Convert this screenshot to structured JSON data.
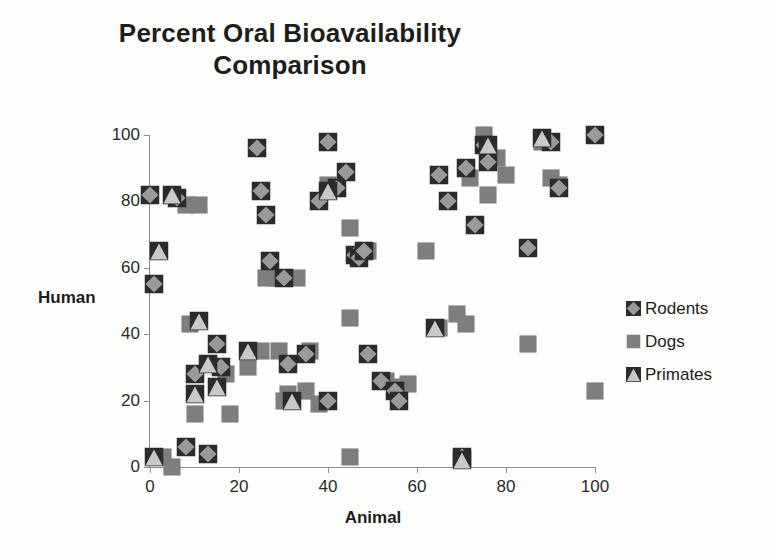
{
  "chart_data": {
    "type": "scatter",
    "title": "Percent Oral Bioavailability Comparison",
    "title_lines": [
      "Percent Oral Bioavailability",
      "Comparison"
    ],
    "xlabel": "Animal",
    "ylabel": "Human",
    "xlim": [
      0,
      100
    ],
    "ylim": [
      0,
      100
    ],
    "xticks": [
      0,
      20,
      40,
      60,
      80,
      100
    ],
    "yticks": [
      0,
      20,
      40,
      60,
      80,
      100
    ],
    "grid": false,
    "legend_position": "right",
    "colors": {
      "rodents": "#9a9a9a",
      "dogs": "#7e7e7e",
      "primates": "#c9c9c9",
      "marker_outline": "#2b2b2b",
      "axis": "#8c8c8c",
      "text": "#1d1d1d",
      "background": "#fdfdfc"
    },
    "series": [
      {
        "name": "Rodents",
        "marker": "diamond",
        "color": "#9a9a9a",
        "points": [
          [
            0,
            82
          ],
          [
            1,
            55
          ],
          [
            6,
            81
          ],
          [
            8,
            6
          ],
          [
            10,
            28
          ],
          [
            13,
            4
          ],
          [
            15,
            37
          ],
          [
            16,
            30
          ],
          [
            24,
            96
          ],
          [
            25,
            83
          ],
          [
            26,
            76
          ],
          [
            27,
            62
          ],
          [
            30,
            57
          ],
          [
            31,
            31
          ],
          [
            35,
            34
          ],
          [
            38,
            80
          ],
          [
            40,
            98
          ],
          [
            40,
            20
          ],
          [
            42,
            84
          ],
          [
            44,
            89
          ],
          [
            46,
            64
          ],
          [
            47,
            63
          ],
          [
            48,
            65
          ],
          [
            49,
            34
          ],
          [
            52,
            26
          ],
          [
            55,
            23
          ],
          [
            56,
            20
          ],
          [
            65,
            88
          ],
          [
            67,
            80
          ],
          [
            70,
            3
          ],
          [
            71,
            90
          ],
          [
            73,
            73
          ],
          [
            75,
            97
          ],
          [
            76,
            92
          ],
          [
            85,
            66
          ],
          [
            90,
            98
          ],
          [
            92,
            84
          ],
          [
            100,
            100
          ]
        ]
      },
      {
        "name": "Dogs",
        "marker": "square",
        "color": "#7e7e7e",
        "points": [
          [
            3,
            3
          ],
          [
            5,
            0
          ],
          [
            8,
            79
          ],
          [
            9,
            43
          ],
          [
            10,
            16
          ],
          [
            11,
            79
          ],
          [
            17,
            28
          ],
          [
            18,
            16
          ],
          [
            22,
            30
          ],
          [
            25,
            35
          ],
          [
            26,
            57
          ],
          [
            28,
            57
          ],
          [
            29,
            35
          ],
          [
            30,
            20
          ],
          [
            31,
            22
          ],
          [
            33,
            57
          ],
          [
            35,
            23
          ],
          [
            36,
            35
          ],
          [
            38,
            19
          ],
          [
            40,
            85
          ],
          [
            45,
            3
          ],
          [
            45,
            45
          ],
          [
            45,
            72
          ],
          [
            47,
            64
          ],
          [
            49,
            65
          ],
          [
            53,
            26
          ],
          [
            55,
            24
          ],
          [
            58,
            25
          ],
          [
            62,
            65
          ],
          [
            65,
            42
          ],
          [
            69,
            46
          ],
          [
            71,
            43
          ],
          [
            72,
            87
          ],
          [
            75,
            100
          ],
          [
            76,
            82
          ],
          [
            78,
            93
          ],
          [
            80,
            88
          ],
          [
            85,
            37
          ],
          [
            88,
            98
          ],
          [
            90,
            87
          ],
          [
            92,
            85
          ],
          [
            100,
            23
          ]
        ]
      },
      {
        "name": "Primates",
        "marker": "triangle",
        "color": "#c9c9c9",
        "points": [
          [
            1,
            3
          ],
          [
            2,
            65
          ],
          [
            5,
            82
          ],
          [
            10,
            22
          ],
          [
            11,
            44
          ],
          [
            13,
            31
          ],
          [
            15,
            24
          ],
          [
            22,
            35
          ],
          [
            32,
            20
          ],
          [
            40,
            83
          ],
          [
            64,
            42
          ],
          [
            70,
            2
          ],
          [
            76,
            97
          ],
          [
            88,
            99
          ]
        ]
      }
    ]
  },
  "legend": {
    "items": [
      {
        "label": "Rodents",
        "marker": "diamond-icon"
      },
      {
        "label": "Dogs",
        "marker": "square-icon"
      },
      {
        "label": "Primates",
        "marker": "triangle-icon"
      }
    ]
  }
}
